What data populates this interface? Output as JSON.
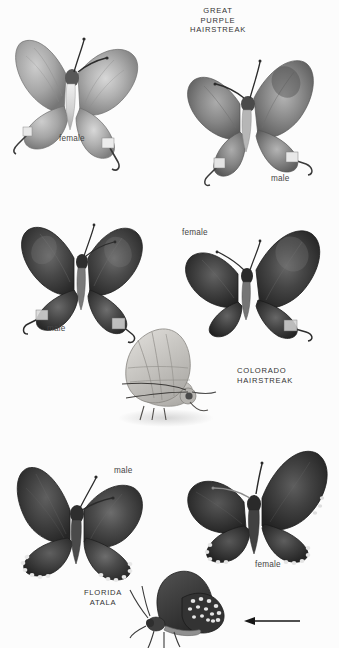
{
  "plate": {
    "background_color": "#fcfcfc",
    "ink_color": "#3a3a3a",
    "width": 339,
    "height": 648
  },
  "species": [
    {
      "id": "great-purple-hairstreak",
      "name": "GREAT\nPURPLE\nHAIRSTREAK",
      "name_lines": [
        "GREAT",
        "PURPLE",
        "HAIRSTREAK"
      ]
    },
    {
      "id": "colorado-hairstreak",
      "name": "COLORADO\nHAIRSTREAK",
      "name_lines": [
        "COLORADO",
        "HAIRSTREAK"
      ]
    },
    {
      "id": "florida-atala",
      "name": "FLORIDA\nATALA",
      "name_lines": [
        "FLORIDA",
        "ATALA"
      ]
    }
  ],
  "labels": {
    "gph_female": "female",
    "gph_male": "male",
    "ch_male": "male",
    "ch_female": "female",
    "fa_male": "male",
    "fa_female": "female"
  },
  "specimens": [
    {
      "id": "gph-female",
      "species": "great-purple-hairstreak",
      "sex": "female",
      "view": "dorsal",
      "wing_tone": "#a9a9a9",
      "body_tone": "#cfcfcf"
    },
    {
      "id": "gph-male",
      "species": "great-purple-hairstreak",
      "sex": "male",
      "view": "dorsal",
      "wing_tone": "#8c8c8c",
      "body_tone": "#b8b8b8"
    },
    {
      "id": "ch-male",
      "species": "colorado-hairstreak",
      "sex": "male",
      "view": "dorsal",
      "wing_tone": "#4a4a4a",
      "body_tone": "#6d6d6d"
    },
    {
      "id": "ch-female",
      "species": "colorado-hairstreak",
      "sex": "female",
      "view": "dorsal",
      "wing_tone": "#444444",
      "body_tone": "#6a6a6a"
    },
    {
      "id": "ch-ventral",
      "species": "colorado-hairstreak",
      "sex": "",
      "view": "ventral-lateral",
      "wing_tone": "#c8c6c2",
      "body_tone": "#b4b2ae"
    },
    {
      "id": "fa-male",
      "species": "florida-atala",
      "sex": "male",
      "view": "dorsal",
      "wing_tone": "#4b4b4b",
      "body_tone": "#555555"
    },
    {
      "id": "fa-female",
      "species": "florida-atala",
      "sex": "female",
      "view": "dorsal",
      "wing_tone": "#3f3f3f",
      "body_tone": "#4d4d4d"
    },
    {
      "id": "fa-ventral",
      "species": "florida-atala",
      "sex": "",
      "view": "ventral-lateral",
      "wing_tone": "#3c3c3c",
      "body_tone": "#4a4a4a"
    }
  ],
  "annotations": {
    "abdomen_pointer": "arrow-pointing-left-at-abdomen"
  }
}
